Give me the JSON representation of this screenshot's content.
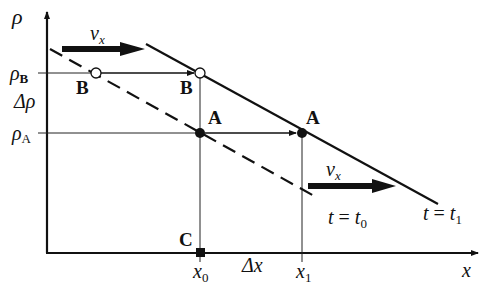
{
  "diagram": {
    "axes": {
      "y_label": "ρ",
      "x_label": "x"
    },
    "y_ticks": [
      {
        "id": "rhoB",
        "symbol": "ρ",
        "subscript": "B"
      },
      {
        "id": "rhoA",
        "symbol": "ρ",
        "subscript": "A"
      }
    ],
    "delta_rho_label": "Δρ",
    "x_ticks": [
      {
        "id": "x0",
        "symbol": "x",
        "subscript": "0"
      },
      {
        "id": "x1",
        "symbol": "x",
        "subscript": "1"
      }
    ],
    "delta_x_label": "Δx",
    "velocity_labels": [
      {
        "symbol": "v",
        "subscript": "x"
      },
      {
        "symbol": "v",
        "subscript": "x"
      }
    ],
    "curves": [
      {
        "id": "t0",
        "style": "dashed",
        "label_t": "t",
        "label_eq": " = ",
        "label_sym": "t",
        "label_sub": "0"
      },
      {
        "id": "t1",
        "style": "solid",
        "label_t": "t",
        "label_eq": " = ",
        "label_sym": "t",
        "label_sub": "1"
      }
    ],
    "points": [
      {
        "id": "B0",
        "label": "B",
        "fill": "open"
      },
      {
        "id": "B1",
        "label": "B",
        "fill": "open"
      },
      {
        "id": "A0",
        "label": "A",
        "fill": "filled"
      },
      {
        "id": "A1",
        "label": "A",
        "fill": "filled"
      },
      {
        "id": "C",
        "label": "C",
        "fill": "square"
      }
    ],
    "colors": {
      "ink": "#111111",
      "open_fill": "#ffffff"
    }
  }
}
